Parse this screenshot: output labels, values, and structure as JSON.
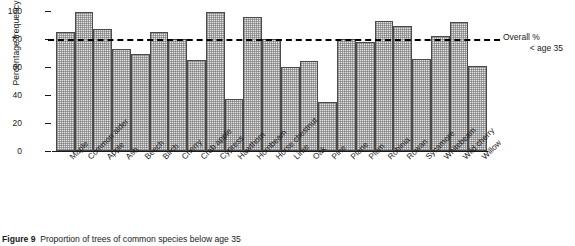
{
  "figure": {
    "caption_label": "Figure 9",
    "caption_text": "Proportion of trees of common species below age 35"
  },
  "axes": {
    "ylabel": "Percentage frequency",
    "yticks": [
      "100",
      "80",
      "60",
      "40",
      "20",
      "0"
    ],
    "ymin": 0,
    "ymax": 100
  },
  "reference": {
    "value": 80,
    "label_line1": "Overall %",
    "label_line2": "< age 35"
  },
  "chart_data": {
    "type": "bar",
    "title": "Proportion of trees of common species below age 35",
    "xlabel": "",
    "ylabel": "Percentage frequency",
    "ylim": [
      0,
      100
    ],
    "ytick_values": [
      0,
      20,
      40,
      60,
      80,
      100
    ],
    "grid": false,
    "legend_position": "right",
    "categories": [
      "Maple",
      "Common alder",
      "Apple",
      "Ash",
      "Beech",
      "Birch",
      "Cherry",
      "Crab apple",
      "Cypress",
      "Hawthorn",
      "Hornbeam",
      "Horse chestnut",
      "Lime",
      "Oak",
      "Pine",
      "Plane",
      "Plum",
      "Robinia",
      "Rowan",
      "Sycamore",
      "Whitebeam",
      "Wild cherry",
      "Willow"
    ],
    "values": [
      85,
      99,
      87,
      73,
      69,
      85,
      80,
      65,
      99,
      37,
      96,
      80,
      60,
      64,
      35,
      80,
      78,
      93,
      89,
      66,
      82,
      92,
      61
    ],
    "annotations": [
      {
        "type": "hline",
        "value": 80,
        "label": "Overall % < age 35",
        "style": "dashed"
      }
    ]
  }
}
